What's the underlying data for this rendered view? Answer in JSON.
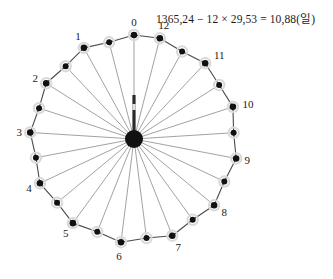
{
  "figure": {
    "title_equation": "1365,24 − 12 × 29,53 = 10,88(일)",
    "equation_parts": {
      "solar_year_days": "1365,24",
      "lunar_months": "12",
      "synodic_month_days": "29,53",
      "remainder_days": "10,88",
      "unit": "일"
    },
    "colors": {
      "spoke": "#8a8a8a",
      "rim": "#4a4a4a",
      "dot": "#111111",
      "halo": "#d9d9d9",
      "hub": "#111111",
      "text": "#1a1a1a"
    },
    "geometry": {
      "center_x": 134,
      "center_y": 139,
      "radius": 104,
      "dot_count": 25,
      "hub_radius": 9,
      "pointer_top_y": 95
    }
  },
  "chart_data": {
    "type": "scatter",
    "title": "1365,24 − 12 × 29,53 = 10,88(일)",
    "xlabel": "",
    "ylabel": "",
    "dot_count": 25,
    "angle_step_degrees": 14.4,
    "start_angle_degrees": -90,
    "labels": [
      "0",
      "12",
      "11",
      "10",
      "9",
      "8",
      "7",
      "6",
      "5",
      "4",
      "3",
      "2",
      "1"
    ],
    "labelled_indices": [
      0,
      1,
      3,
      5,
      7,
      9,
      11,
      13,
      15,
      17,
      19,
      21,
      23
    ],
    "points": [
      {
        "index": 0,
        "label": "0",
        "angle": -90.0,
        "r_factor": 1.0,
        "labelled": true,
        "label_dx": 0,
        "label_dy": -13
      },
      {
        "index": 1,
        "label": "12",
        "angle": -75.6,
        "r_factor": 1.0,
        "labelled": true,
        "label_dx": 4,
        "label_dy": -13
      },
      {
        "index": 2,
        "label": "",
        "angle": -61.2,
        "r_factor": 0.96,
        "labelled": false,
        "label_dx": 0,
        "label_dy": 0
      },
      {
        "index": 3,
        "label": "11",
        "angle": -46.8,
        "r_factor": 1.0,
        "labelled": true,
        "label_dx": 14,
        "label_dy": -8
      },
      {
        "index": 4,
        "label": "",
        "angle": -32.4,
        "r_factor": 0.97,
        "labelled": false,
        "label_dx": 0,
        "label_dy": 0
      },
      {
        "index": 5,
        "label": "10",
        "angle": -18.0,
        "r_factor": 1.0,
        "labelled": true,
        "label_dx": 15,
        "label_dy": -3
      },
      {
        "index": 6,
        "label": "",
        "angle": -3.6,
        "r_factor": 0.96,
        "labelled": false,
        "label_dx": 0,
        "label_dy": 0
      },
      {
        "index": 7,
        "label": "9",
        "angle": 10.8,
        "r_factor": 1.0,
        "labelled": true,
        "label_dx": 11,
        "label_dy": 2
      },
      {
        "index": 8,
        "label": "",
        "angle": 25.2,
        "r_factor": 0.96,
        "labelled": false,
        "label_dx": 0,
        "label_dy": 0
      },
      {
        "index": 9,
        "label": "8",
        "angle": 39.6,
        "r_factor": 1.0,
        "labelled": true,
        "label_dx": 10,
        "label_dy": 7
      },
      {
        "index": 10,
        "label": "",
        "angle": 54.0,
        "r_factor": 0.96,
        "labelled": false,
        "label_dx": 0,
        "label_dy": 0
      },
      {
        "index": 11,
        "label": "7",
        "angle": 68.4,
        "r_factor": 1.0,
        "labelled": true,
        "label_dx": 6,
        "label_dy": 11
      },
      {
        "index": 12,
        "label": "",
        "angle": 82.8,
        "r_factor": 0.96,
        "labelled": false,
        "label_dx": 0,
        "label_dy": 0
      },
      {
        "index": 13,
        "label": "6",
        "angle": 97.2,
        "r_factor": 1.0,
        "labelled": true,
        "label_dx": -2,
        "label_dy": 14
      },
      {
        "index": 14,
        "label": "",
        "angle": 111.6,
        "r_factor": 0.96,
        "labelled": false,
        "label_dx": 0,
        "label_dy": 0
      },
      {
        "index": 15,
        "label": "5",
        "angle": 126.0,
        "r_factor": 1.0,
        "labelled": true,
        "label_dx": -7,
        "label_dy": 10
      },
      {
        "index": 16,
        "label": "",
        "angle": 140.4,
        "r_factor": 0.96,
        "labelled": false,
        "label_dx": 0,
        "label_dy": 0
      },
      {
        "index": 17,
        "label": "4",
        "angle": 154.8,
        "r_factor": 1.0,
        "labelled": true,
        "label_dx": -11,
        "label_dy": 5
      },
      {
        "index": 18,
        "label": "",
        "angle": 169.2,
        "r_factor": 0.96,
        "labelled": false,
        "label_dx": 0,
        "label_dy": 0
      },
      {
        "index": 19,
        "label": "3",
        "angle": 183.6,
        "r_factor": 1.0,
        "labelled": true,
        "label_dx": -11,
        "label_dy": 0
      },
      {
        "index": 20,
        "label": "",
        "angle": 198.0,
        "r_factor": 0.96,
        "labelled": false,
        "label_dx": 0,
        "label_dy": 0
      },
      {
        "index": 21,
        "label": "2",
        "angle": 212.4,
        "r_factor": 1.0,
        "labelled": true,
        "label_dx": -11,
        "label_dy": -5
      },
      {
        "index": 22,
        "label": "",
        "angle": 226.8,
        "r_factor": 0.96,
        "labelled": false,
        "label_dx": 0,
        "label_dy": 0
      },
      {
        "index": 23,
        "label": "1",
        "angle": 241.2,
        "r_factor": 1.0,
        "labelled": true,
        "label_dx": -6,
        "label_dy": -12
      },
      {
        "index": 24,
        "label": "",
        "angle": 255.6,
        "r_factor": 0.96,
        "labelled": false,
        "label_dx": 0,
        "label_dy": 0
      }
    ]
  }
}
